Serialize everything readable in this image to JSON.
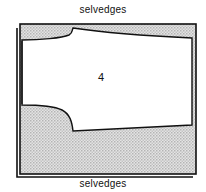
{
  "diagram": {
    "top_label": "selvedges",
    "bottom_label": "selvedges",
    "piece_number": "4",
    "colors": {
      "outline": "#111111",
      "shading": "#cfcfcf",
      "background": "#ffffff"
    }
  }
}
